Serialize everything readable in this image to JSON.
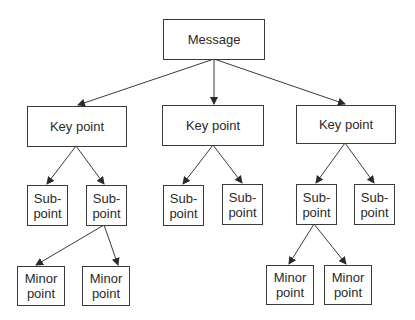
{
  "diagram": {
    "type": "tree",
    "nodes": {
      "root": {
        "label": "Message"
      },
      "k1": {
        "label": "Key point"
      },
      "k2": {
        "label": "Key point"
      },
      "k3": {
        "label": "Key point"
      },
      "s1": {
        "label": "Sub-\npoint"
      },
      "s2": {
        "label": "Sub-\npoint"
      },
      "s3": {
        "label": "Sub-\npoint"
      },
      "s4": {
        "label": "Sub-\npoint"
      },
      "s5": {
        "label": "Sub-\npoint"
      },
      "s6": {
        "label": "Sub-\npoint"
      },
      "m1": {
        "label": "Minor\npoint"
      },
      "m2": {
        "label": "Minor\npoint"
      },
      "m3": {
        "label": "Minor\npoint"
      },
      "m4": {
        "label": "Minor\npoint"
      }
    },
    "edges": [
      [
        "root",
        "k1"
      ],
      [
        "root",
        "k2"
      ],
      [
        "root",
        "k3"
      ],
      [
        "k1",
        "s1"
      ],
      [
        "k1",
        "s2"
      ],
      [
        "k2",
        "s3"
      ],
      [
        "k2",
        "s4"
      ],
      [
        "k3",
        "s5"
      ],
      [
        "k3",
        "s6"
      ],
      [
        "s2",
        "m1"
      ],
      [
        "s2",
        "m2"
      ],
      [
        "s5",
        "m3"
      ],
      [
        "s5",
        "m4"
      ]
    ],
    "colors": {
      "line": "#3a3a3a",
      "text": "#2a2a2a",
      "background": "#ffffff"
    }
  }
}
